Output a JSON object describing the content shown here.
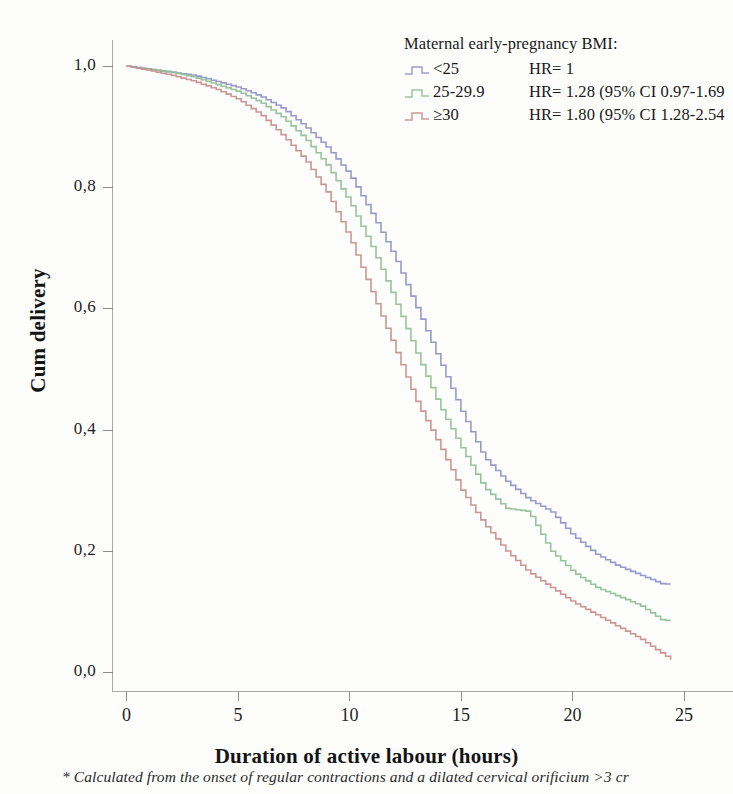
{
  "chart_data": {
    "type": "line",
    "subtype": "kaplan-meier-step",
    "title": "",
    "xlabel": "Duration of active labour (hours)",
    "ylabel": "Cum delivery",
    "xlim": [
      -0.6,
      27.2
    ],
    "ylim": [
      -0.03,
      1.04
    ],
    "xticks": [
      "0",
      "5",
      "10",
      "15",
      "20",
      "25"
    ],
    "xtick_values": [
      0,
      5,
      10,
      15,
      20,
      25
    ],
    "yticks": [
      "0,0",
      "0,2",
      "0,4",
      "0,6",
      "0,8",
      "1,0"
    ],
    "ytick_values": [
      0.0,
      0.2,
      0.4,
      0.6,
      0.8,
      1.0
    ],
    "grid": false,
    "legend_position": "top-right",
    "decimal_separator": ",",
    "series": [
      {
        "name": "<25",
        "color": "#8e93c8",
        "hr": "HR= 1",
        "x": [
          0,
          1,
          2,
          3,
          4,
          5,
          6,
          7,
          8,
          9,
          10,
          11,
          12,
          13,
          14,
          15,
          16,
          17,
          18,
          19,
          20,
          21,
          22,
          23,
          24,
          24.4
        ],
        "y": [
          1.0,
          0.995,
          0.99,
          0.985,
          0.975,
          0.965,
          0.95,
          0.93,
          0.9,
          0.865,
          0.82,
          0.755,
          0.685,
          0.6,
          0.515,
          0.43,
          0.355,
          0.315,
          0.285,
          0.265,
          0.225,
          0.195,
          0.175,
          0.16,
          0.145,
          0.145
        ]
      },
      {
        "name": "25-29.9",
        "color": "#8fbf95",
        "hr": "HR= 1.28 (95% CI 0.97-1.69",
        "x": [
          0,
          1,
          2,
          3,
          4,
          5,
          6,
          7,
          8,
          9,
          10,
          11,
          12,
          13,
          14,
          15,
          16,
          17,
          18,
          19,
          20,
          21,
          22,
          23,
          24,
          24.4
        ],
        "y": [
          1.0,
          0.995,
          0.99,
          0.982,
          0.97,
          0.958,
          0.94,
          0.915,
          0.88,
          0.835,
          0.775,
          0.7,
          0.615,
          0.525,
          0.44,
          0.37,
          0.305,
          0.27,
          0.265,
          0.2,
          0.165,
          0.14,
          0.125,
          0.11,
          0.085,
          0.085
        ]
      },
      {
        "name": "≥30",
        "color": "#c98d8d",
        "hr": "HR= 1.80 (95% CI 1.28-2.54",
        "x": [
          0,
          1,
          2,
          3,
          4,
          5,
          6,
          7,
          8,
          9,
          10,
          11,
          12,
          13,
          14,
          15,
          16,
          17,
          18,
          19,
          20,
          21,
          22,
          23,
          24,
          24.4
        ],
        "y": [
          1.0,
          0.993,
          0.985,
          0.975,
          0.962,
          0.945,
          0.92,
          0.885,
          0.845,
          0.79,
          0.715,
          0.625,
          0.535,
          0.445,
          0.375,
          0.3,
          0.245,
          0.2,
          0.165,
          0.14,
          0.115,
          0.095,
          0.075,
          0.055,
          0.03,
          0.02
        ]
      }
    ]
  },
  "legend": {
    "title": "Maternal early-pregnancy BMI:",
    "rows": [
      {
        "label": "<25",
        "hr": "HR= 1"
      },
      {
        "label": "25-29.9",
        "hr": "HR= 1.28 (95% CI 0.97-1.69"
      },
      {
        "label": "≥30",
        "hr": "HR= 1.80 (95% CI 1.28-2.54"
      }
    ]
  },
  "axes": {
    "y_title": "Cum delivery",
    "x_title": "Duration of active labour (hours)"
  },
  "footnote": "* Calculated from the onset of regular contractions and a dilated cervical orificium >3 cr",
  "colors": {
    "series_1": "#8e93c8",
    "series_2": "#8fbf95",
    "series_3": "#c98d8d",
    "axis": "#a9a9a4",
    "text": "#1f1f1f",
    "background": "#fdfdfc"
  }
}
